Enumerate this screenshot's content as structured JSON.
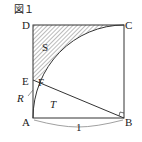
{
  "figure": {
    "title": "図１",
    "points": {
      "A": "A",
      "B": "B",
      "C": "C",
      "D": "D",
      "E": "E",
      "F": "F"
    },
    "regions": {
      "S": "S",
      "T": "T",
      "R": "R"
    },
    "side_length_label": "1",
    "colors": {
      "stroke": "#333333",
      "hatch": "#555555",
      "background": "#ffffff"
    }
  }
}
